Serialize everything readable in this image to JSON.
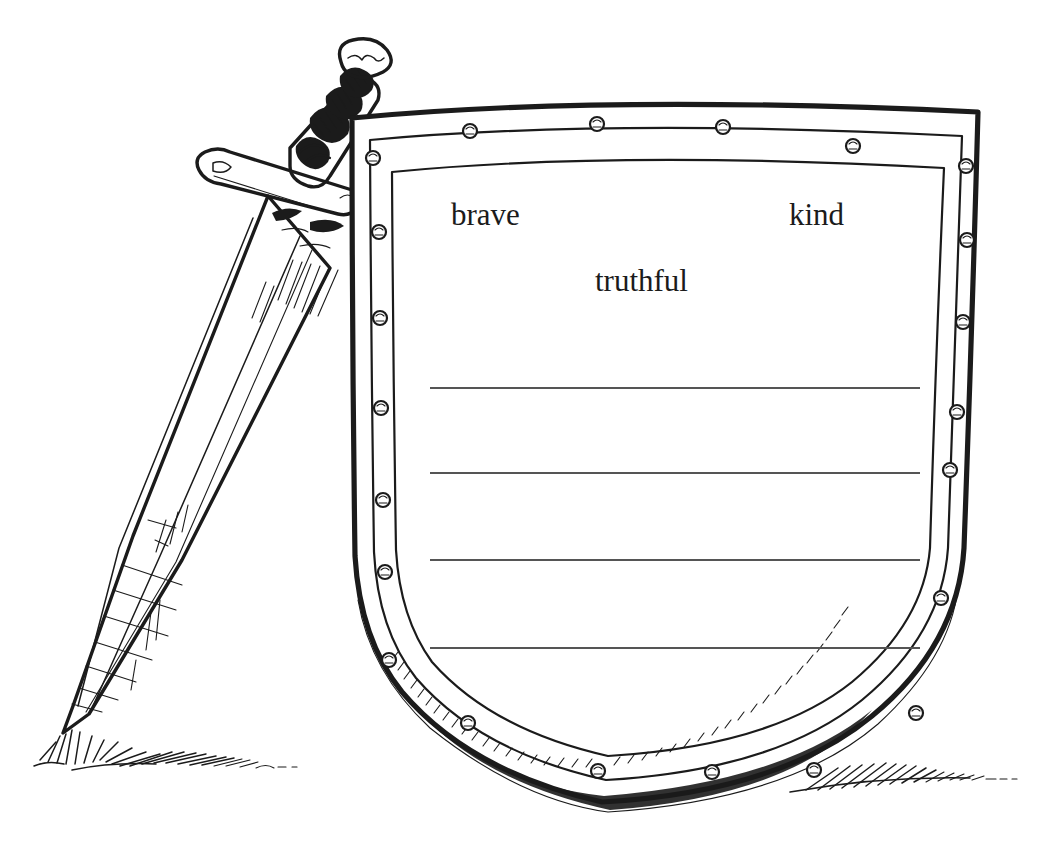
{
  "page": {
    "kind": "coloring-worksheet",
    "background_color": "#ffffff",
    "ink_color": "#1b1b1b",
    "rule_line_color": "#555555",
    "width": 1051,
    "height": 865
  },
  "illustration": {
    "style": "black-and-white pen line drawing",
    "objects": [
      {
        "name": "sword",
        "description": "sword with wrapped grip, round pommel and crossguard, blade point stuck into the ground"
      },
      {
        "name": "shield",
        "description": "heater shield with riveted rim and blank inner panel"
      },
      {
        "name": "grass-left",
        "description": "tuft of grass around the sword point"
      },
      {
        "name": "grass-right",
        "description": "grass along the bottom-right edge of the shield"
      }
    ]
  },
  "shield": {
    "rivet_count": 22,
    "writing_lines": 4,
    "line_start_x": 430,
    "line_end_x": 920,
    "line_y_positions": [
      388,
      473,
      560,
      648
    ]
  },
  "words": [
    {
      "id": "brave",
      "text": "brave"
    },
    {
      "id": "kind",
      "text": "kind"
    },
    {
      "id": "truthful",
      "text": "truthful"
    }
  ]
}
